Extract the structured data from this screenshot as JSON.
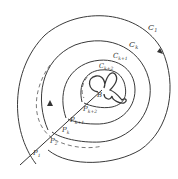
{
  "diagram": {
    "curves": {
      "c1": "C",
      "c1_sub": "1",
      "ck": "C",
      "ck_sub": "k",
      "ck1": "C",
      "ck1_sub": "k+1",
      "ck2": "C",
      "ck2_sub": "k+2"
    },
    "points": {
      "p1": "P",
      "p1_sub": "1",
      "p2": "P",
      "p2_sub": "2",
      "pk": "P",
      "pk_sub": "k",
      "pk1": "P",
      "pk1_sub": "k+1",
      "pk2": "P",
      "pk2_sub": "k+2",
      "b": "B"
    }
  }
}
